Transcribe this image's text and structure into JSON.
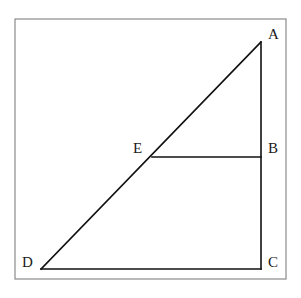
{
  "diagram": {
    "type": "geometry",
    "points": {
      "A": {
        "label": "A",
        "x": 261,
        "y": 42
      },
      "B": {
        "label": "B",
        "x": 261,
        "y": 157
      },
      "C": {
        "label": "C",
        "x": 261,
        "y": 269
      },
      "D": {
        "label": "D",
        "x": 41,
        "y": 269
      },
      "E": {
        "label": "E",
        "x": 152,
        "y": 157
      }
    },
    "segments": [
      {
        "from": "A",
        "to": "C"
      },
      {
        "from": "C",
        "to": "D"
      },
      {
        "from": "D",
        "to": "A"
      },
      {
        "from": "E",
        "to": "B"
      }
    ],
    "labels": {
      "A": "A",
      "B": "B",
      "C": "C",
      "D": "D",
      "E": "E"
    },
    "colors": {
      "line": "#111111",
      "frame": "#8a8a8a",
      "background": "#ffffff"
    }
  }
}
